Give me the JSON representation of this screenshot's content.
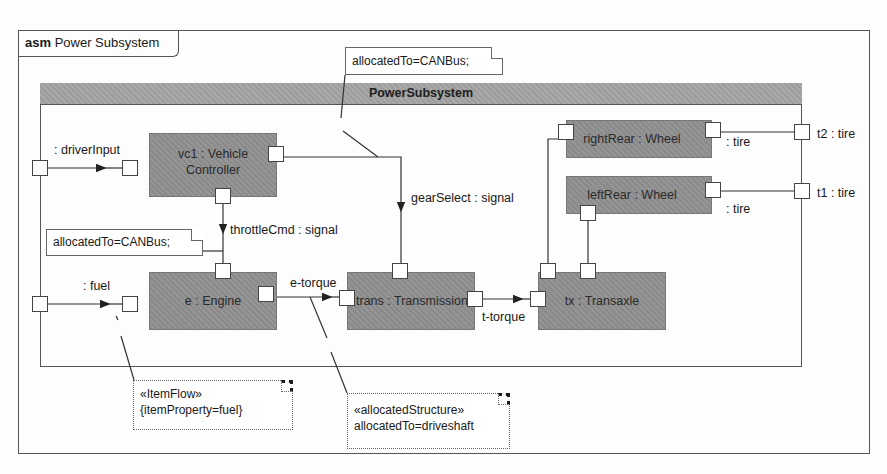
{
  "diagram": {
    "frame": {
      "kind": "asm",
      "title": "Power Subsystem"
    },
    "part": {
      "title": "PowerSubsystem"
    },
    "blocks": [
      {
        "id": "vc1",
        "label_line1": "vc1 : Vehicle",
        "label_line2": "Controller"
      },
      {
        "id": "engine",
        "label": "e : Engine"
      },
      {
        "id": "trans",
        "label": "trans : Transmission"
      },
      {
        "id": "tx",
        "label": "tx : Transaxle"
      },
      {
        "id": "rightRear",
        "label": "rightRear : Wheel"
      },
      {
        "id": "leftRear",
        "label": "leftRear : Wheel"
      }
    ],
    "boundary_ports": [
      {
        "id": "driverInput",
        "label": ": driverInput"
      },
      {
        "id": "fuel",
        "label": ": fuel"
      },
      {
        "id": "t2",
        "label": "t2 : tire"
      },
      {
        "id": "t1",
        "label": "t1 : tire"
      }
    ],
    "connectors": [
      {
        "label": "throttleCmd : signal"
      },
      {
        "label": "gearSelect : signal"
      },
      {
        "label": "e-torque"
      },
      {
        "label": "t-torque"
      },
      {
        "label": ": tire"
      },
      {
        "label": ": tire"
      }
    ],
    "notes": [
      {
        "id": "note-top",
        "line1": "allocatedTo=CANBus;"
      },
      {
        "id": "note-left",
        "line1": "allocatedTo=CANBus;"
      },
      {
        "id": "note-itemflow",
        "line1": "«ItemFlow»",
        "line2": "{itemProperty=fuel}"
      },
      {
        "id": "note-alloc",
        "line1": "«allocatedStructure»",
        "line2": "allocatedTo=driveshaft"
      }
    ]
  }
}
